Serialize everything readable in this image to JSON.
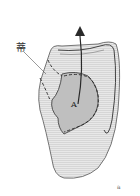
{
  "figure": {
    "labels": {
      "pedicle": "蒂",
      "flap": "A",
      "panel": "a"
    },
    "colors": {
      "ear_fill": "#e6e6e6",
      "ear_shadow": "#cfcfcf",
      "flap_fill": "#bdbdbd",
      "outline": "#3a3a3a",
      "arrow": "#2a2a2a"
    }
  }
}
